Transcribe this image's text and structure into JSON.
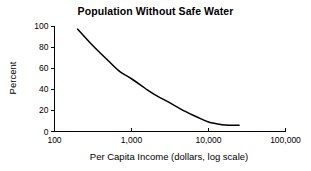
{
  "chart_data": {
    "type": "line",
    "title": "Population Without Safe Water",
    "xlabel": "Per Capita Income (dollars, log scale)",
    "ylabel": "Percent",
    "xscale": "log",
    "xlim": [
      100,
      100000
    ],
    "ylim": [
      0,
      100
    ],
    "grid": false,
    "legend": "none",
    "xticks": [
      100,
      1000,
      10000,
      100000
    ],
    "xticklabels": [
      "100",
      "1,000",
      "10,000",
      "100,000"
    ],
    "yticks": [
      0,
      20,
      40,
      60,
      80,
      100
    ],
    "yticklabels": [
      "0",
      "20",
      "40",
      "60",
      "80",
      "100"
    ],
    "series": [
      {
        "name": "Population without safe water",
        "x": [
          200,
          300,
          500,
          700,
          1000,
          1500,
          2000,
          3000,
          5000,
          7000,
          10000,
          15000,
          20000,
          25000
        ],
        "values": [
          97,
          83,
          67,
          57,
          50,
          41,
          35,
          28,
          19,
          14,
          9,
          6.5,
          6,
          6
        ]
      }
    ],
    "line_color": "#000000"
  },
  "chart_title": "Population Without Safe Water",
  "axes": {
    "x_title": "Per Capita Income (dollars, log scale)",
    "y_title": "Percent",
    "x_labels": [
      "100",
      "1,000",
      "10,000",
      "100,000"
    ],
    "y_labels": [
      "0",
      "20",
      "40",
      "60",
      "80",
      "100"
    ]
  }
}
